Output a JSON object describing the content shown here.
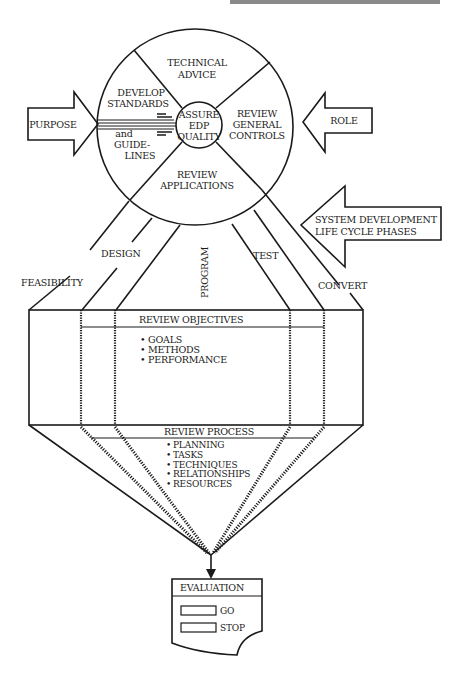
{
  "header": {
    "running_head": "Managing Edp Quality"
  },
  "circle": {
    "center": "ASSURE EDP QUALITY",
    "center_lines": [
      "ASSURE",
      "EDP",
      "QUALITY"
    ],
    "top": [
      "TECHNICAL",
      "ADVICE"
    ],
    "left_upper": [
      "DEVELOP",
      "STANDARDS"
    ],
    "left_lower": [
      "and",
      "GUIDE-",
      "LINES"
    ],
    "right": [
      "REVIEW",
      "GENERAL",
      "CONTROLS"
    ],
    "bottom": [
      "REVIEW",
      "APPLICATIONS"
    ]
  },
  "arrows": {
    "purpose": "PURPOSE",
    "role": "ROLE",
    "sdlc": [
      "SYSTEM DEVELOPMENT",
      "LIFE CYCLE PHASES"
    ]
  },
  "phases": {
    "feasibility": "FEASIBILITY",
    "design": "DESIGN",
    "program": "PROGRAM",
    "test": "TEST",
    "convert": "CONVERT"
  },
  "review_objectives": {
    "title": "REVIEW OBJECTIVES",
    "items": [
      "GOALS",
      "METHODS",
      "PERFORMANCE"
    ]
  },
  "review_process": {
    "title": "REVIEW PROCESS",
    "items": [
      "PLANNING",
      "TASKS",
      "TECHNIQUES",
      "RELATIONSHIPS",
      "RESOURCES"
    ]
  },
  "evaluation": {
    "title": "EVALUATION",
    "options": [
      "GO",
      "STOP"
    ]
  },
  "colors": {
    "ink": "#1a1a1a",
    "paper": "#ffffff"
  }
}
